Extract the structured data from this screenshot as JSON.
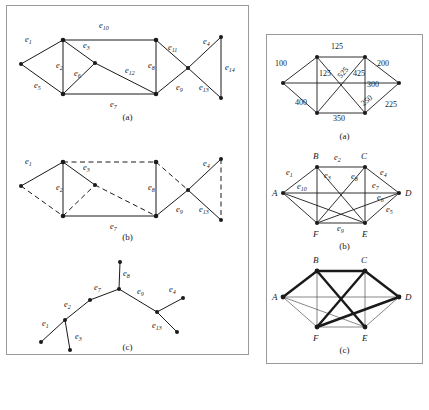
{
  "figure": {
    "left_panel": {
      "caption_a": "(a)",
      "caption_b": "(b)",
      "caption_c": "(c)",
      "edge_labels": [
        "e1",
        "e2",
        "e3",
        "e4",
        "e5",
        "e6",
        "e7",
        "e8",
        "e9",
        "e10",
        "e11",
        "e12",
        "e13",
        "e14"
      ],
      "panel_a": {
        "description": "Connected undirected graph with 14 labelled edges",
        "vertices": [
          {
            "id": "v1",
            "x": 14,
            "y": 58
          },
          {
            "id": "v2",
            "x": 56,
            "y": 34
          },
          {
            "id": "v3",
            "x": 56,
            "y": 88
          },
          {
            "id": "v4",
            "x": 88,
            "y": 57
          },
          {
            "id": "v5",
            "x": 149,
            "y": 34
          },
          {
            "id": "v6",
            "x": 149,
            "y": 88
          },
          {
            "id": "v7",
            "x": 181,
            "y": 62
          },
          {
            "id": "v8",
            "x": 214,
            "y": 31
          },
          {
            "id": "v9",
            "x": 214,
            "y": 92
          }
        ],
        "edges": [
          {
            "label": "e1",
            "from": "v1",
            "to": "v2",
            "style": "solid",
            "lx": 18,
            "ly": 36
          },
          {
            "label": "e2",
            "from": "v2",
            "to": "v3",
            "style": "solid",
            "lx": 49,
            "ly": 62
          },
          {
            "label": "e3",
            "from": "v2",
            "to": "v4",
            "style": "solid",
            "lx": 76,
            "ly": 42
          },
          {
            "label": "e4",
            "from": "v7",
            "to": "v8",
            "style": "solid",
            "lx": 196,
            "ly": 38
          },
          {
            "label": "e5",
            "from": "v1",
            "to": "v3",
            "style": "solid",
            "lx": 27,
            "ly": 82
          },
          {
            "label": "e6",
            "from": "v3",
            "to": "v4",
            "style": "solid",
            "lx": 67,
            "ly": 70
          },
          {
            "label": "e7",
            "from": "v3",
            "to": "v6",
            "style": "solid",
            "lx": 103,
            "ly": 100
          },
          {
            "label": "e8",
            "from": "v5",
            "to": "v6",
            "style": "solid",
            "lx": 142,
            "ly": 62
          },
          {
            "label": "e9",
            "from": "v6",
            "to": "v7",
            "style": "solid",
            "lx": 172,
            "ly": 83
          },
          {
            "label": "e10",
            "from": "v2",
            "to": "v5",
            "style": "solid",
            "lx": 94,
            "ly": 22
          },
          {
            "label": "e11",
            "from": "v5",
            "to": "v7",
            "style": "solid",
            "lx": 164,
            "ly": 44
          },
          {
            "label": "e12",
            "from": "v4",
            "to": "v6",
            "style": "solid",
            "lx": 121,
            "ly": 66
          },
          {
            "label": "e13",
            "from": "v7",
            "to": "v9",
            "style": "solid",
            "lx": 196,
            "ly": 83
          },
          {
            "label": "e14",
            "from": "v8",
            "to": "v9",
            "style": "solid",
            "lx": 218,
            "ly": 63
          }
        ]
      },
      "panel_b": {
        "description": "Same graph, spanning tree solid and remaining edges dashed",
        "solid_edges": [
          "e1",
          "e2",
          "e3",
          "e4",
          "e7",
          "e8",
          "e9",
          "e13"
        ],
        "dashed_edges": [
          "e5",
          "e6",
          "e10",
          "e11",
          "e12",
          "e14"
        ]
      },
      "panel_c": {
        "description": "Resulting tree drawn separately",
        "vertices": [
          {
            "id": "t1",
            "x": 34,
            "y": 100
          },
          {
            "id": "t2",
            "x": 58,
            "y": 78
          },
          {
            "id": "t3",
            "x": 63,
            "y": 108
          },
          {
            "id": "t4",
            "x": 83,
            "y": 58
          },
          {
            "id": "t5",
            "x": 113,
            "y": 20
          },
          {
            "id": "t6",
            "x": 112,
            "y": 47
          },
          {
            "id": "t7",
            "x": 150,
            "y": 70
          },
          {
            "id": "t8",
            "x": 176,
            "y": 56
          },
          {
            "id": "t9",
            "x": 170,
            "y": 90
          }
        ],
        "edges": [
          {
            "label": "e1",
            "from": "t1",
            "to": "t2",
            "lx": 37,
            "ly": 83
          },
          {
            "label": "e2",
            "from": "t2",
            "to": "t4",
            "lx": 60,
            "ly": 64
          },
          {
            "label": "e3",
            "from": "t2",
            "to": "t3",
            "lx": 69,
            "ly": 95
          },
          {
            "label": "e7",
            "from": "t4",
            "to": "t6",
            "lx": 89,
            "ly": 47
          },
          {
            "label": "e8",
            "from": "t5",
            "to": "t6",
            "lx": 115,
            "ly": 32
          },
          {
            "label": "e9",
            "from": "t6",
            "to": "t7",
            "lx": 132,
            "ly": 52
          },
          {
            "label": "e4",
            "from": "t7",
            "to": "t8",
            "lx": 164,
            "ly": 50
          },
          {
            "label": "e13",
            "from": "t7",
            "to": "t9",
            "lx": 150,
            "ly": 84
          }
        ]
      }
    },
    "right_panel": {
      "caption_a": "(a)",
      "caption_b": "(b)",
      "caption_c": "(c)",
      "vertex_labels": [
        "A",
        "B",
        "C",
        "D",
        "E",
        "F"
      ],
      "edge_labels": [
        "e1",
        "e2",
        "e3",
        "e4",
        "e5",
        "e6",
        "e7",
        "e8",
        "e9",
        "e10"
      ],
      "panel_a": {
        "description": "Complete weighted graph on six vertices",
        "vertices": [
          {
            "id": "A",
            "x": 16,
            "y": 48
          },
          {
            "id": "B",
            "x": 50,
            "y": 22
          },
          {
            "id": "C",
            "x": 98,
            "y": 22
          },
          {
            "id": "D",
            "x": 132,
            "y": 48
          },
          {
            "id": "E",
            "x": 98,
            "y": 78
          },
          {
            "id": "F",
            "x": 50,
            "y": 78
          }
        ],
        "weights": [
          {
            "value": "100",
            "from": "A",
            "to": "B",
            "lx": 18,
            "ly": 28
          },
          {
            "value": "125",
            "from": "B",
            "to": "C",
            "lx": 66,
            "ly": 13
          },
          {
            "value": "125",
            "from": "B",
            "to": "F",
            "lx": 52,
            "ly": 40
          },
          {
            "value": "525",
            "from": "B",
            "to": "E",
            "lx": 72,
            "ly": 38
          },
          {
            "value": "425",
            "from": "C",
            "to": "F",
            "lx": 90,
            "ly": 40
          },
          {
            "value": "200",
            "from": "C",
            "to": "D",
            "lx": 112,
            "ly": 30
          },
          {
            "value": "300",
            "from": "A",
            "to": "D",
            "lx": 104,
            "ly": 51
          },
          {
            "value": "400",
            "from": "A",
            "to": "F",
            "lx": 34,
            "ly": 68
          },
          {
            "value": "350",
            "from": "F",
            "to": "E",
            "lx": 70,
            "ly": 84
          },
          {
            "value": "250",
            "from": "C",
            "to": "E",
            "lx": 98,
            "ly": 66
          },
          {
            "value": "225",
            "from": "D",
            "to": "E",
            "lx": 122,
            "ly": 70
          }
        ]
      },
      "panel_b": {
        "description": "Same graph with edges labelled e1 through e10",
        "vertices": [
          {
            "id": "A",
            "x": 16,
            "y": 48,
            "lx": 5,
            "ly": 51
          },
          {
            "id": "B",
            "x": 50,
            "y": 22,
            "lx": 46,
            "ly": 12
          },
          {
            "id": "C",
            "x": 98,
            "y": 22,
            "lx": 94,
            "ly": 12
          },
          {
            "id": "D",
            "x": 132,
            "y": 48,
            "lx": 138,
            "ly": 51
          },
          {
            "id": "E",
            "x": 98,
            "y": 78,
            "lx": 94,
            "ly": 92
          },
          {
            "id": "F",
            "x": 50,
            "y": 78,
            "lx": 46,
            "ly": 92
          }
        ],
        "edges": [
          {
            "label": "e1",
            "from": "A",
            "to": "B",
            "lx": 20,
            "ly": 29
          },
          {
            "label": "e2",
            "from": "B",
            "to": "C",
            "lx": 68,
            "ly": 14
          },
          {
            "label": "e3",
            "from": "B",
            "to": "E",
            "lx": 59,
            "ly": 32
          },
          {
            "label": "e4",
            "from": "C",
            "to": "D",
            "lx": 114,
            "ly": 29
          },
          {
            "label": "e5",
            "from": "D",
            "to": "E",
            "lx": 122,
            "ly": 68
          },
          {
            "label": "e6",
            "from": "D",
            "to": "F",
            "lx": 113,
            "ly": 55
          },
          {
            "label": "e7",
            "from": "C",
            "to": "E",
            "lx": 110,
            "ly": 43
          },
          {
            "label": "e8",
            "from": "C",
            "to": "F",
            "lx": 86,
            "ly": 32
          },
          {
            "label": "e9",
            "from": "F",
            "to": "E",
            "lx": 72,
            "ly": 84
          },
          {
            "label": "e10",
            "from": "A",
            "to": "D",
            "lx": 35,
            "ly": 44
          }
        ]
      },
      "panel_c": {
        "description": "Same graph with the minimum spanning tree drawn in bold",
        "bold_edges": [
          {
            "from": "A",
            "to": "B"
          },
          {
            "from": "B",
            "to": "C"
          },
          {
            "from": "C",
            "to": "D"
          },
          {
            "from": "B",
            "to": "E"
          },
          {
            "from": "C",
            "to": "F"
          },
          {
            "from": "D",
            "to": "F"
          }
        ],
        "thin_edges": [
          {
            "from": "A",
            "to": "D"
          },
          {
            "from": "A",
            "to": "E"
          },
          {
            "from": "A",
            "to": "F"
          },
          {
            "from": "B",
            "to": "F"
          },
          {
            "from": "C",
            "to": "E"
          },
          {
            "from": "D",
            "to": "E"
          },
          {
            "from": "E",
            "to": "F"
          }
        ]
      }
    }
  }
}
